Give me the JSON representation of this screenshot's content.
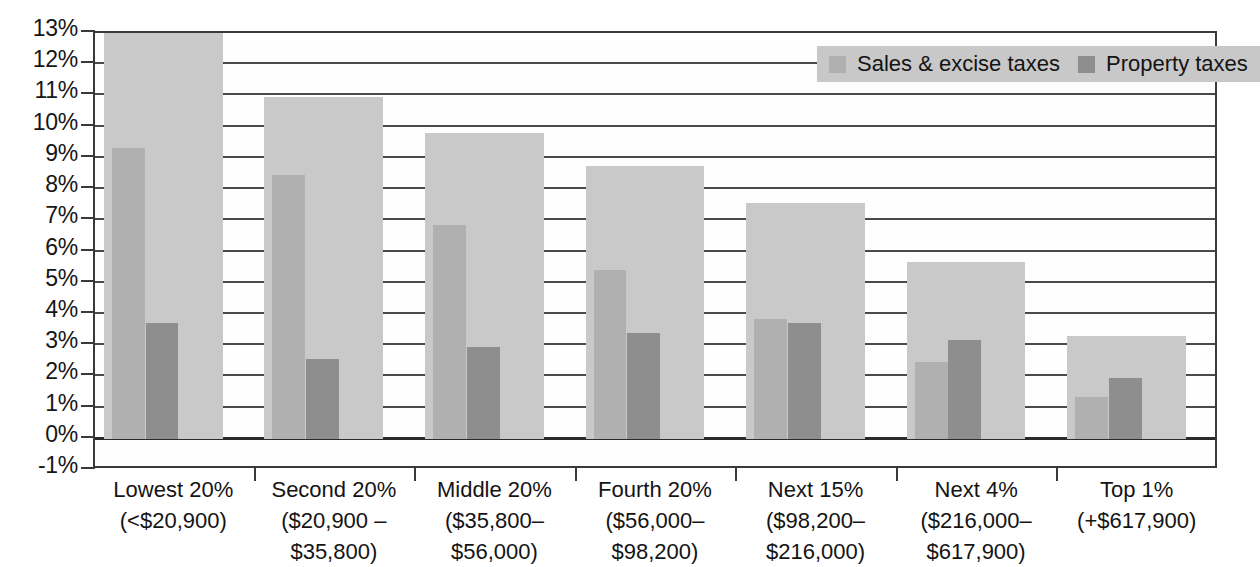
{
  "chart_data": {
    "type": "bar",
    "title": "",
    "xlabel": "",
    "ylabel": "",
    "ylim": [
      -1,
      13
    ],
    "ytick_labels": [
      "13%",
      "12%",
      "11%",
      "10%",
      "9%",
      "8%",
      "7%",
      "6%",
      "5%",
      "4%",
      "3%",
      "2%",
      "1%",
      "0%",
      "-1%"
    ],
    "ytick_values": [
      13,
      12,
      11,
      10,
      9,
      8,
      7,
      6,
      5,
      4,
      3,
      2,
      1,
      0,
      -1
    ],
    "grid": true,
    "legend_position": "top-right",
    "categories": [
      {
        "line1": "Lowest 20%",
        "line2": "(<$20,900)",
        "line3": ""
      },
      {
        "line1": "Second 20%",
        "line2": "($20,900 –",
        "line3": "$35,800)"
      },
      {
        "line1": "Middle 20%",
        "line2": "($35,800–",
        "line3": "$56,000)"
      },
      {
        "line1": "Fourth 20%",
        "line2": "($56,000–",
        "line3": "$98,200)"
      },
      {
        "line1": "Next 15%",
        "line2": "($98,200–",
        "line3": "$216,000)"
      },
      {
        "line1": "Next 4%",
        "line2": "($216,000–",
        "line3": "$617,900)"
      },
      {
        "line1": "Top 1%",
        "line2": "(+$617,900)",
        "line3": ""
      }
    ],
    "series": [
      {
        "name": "Total taxes",
        "key": "total",
        "color": "#c9c9c9",
        "values": [
          13.2,
          10.95,
          9.8,
          8.75,
          7.55,
          5.65,
          3.3
        ]
      },
      {
        "name": "Sales & excise taxes",
        "key": "sales",
        "color": "#b0b0b0",
        "values": [
          9.3,
          8.45,
          6.85,
          5.4,
          3.85,
          2.45,
          1.35
        ]
      },
      {
        "name": "Property taxes",
        "key": "prop",
        "color": "#8e8e8e",
        "values": [
          3.7,
          2.55,
          2.95,
          3.4,
          3.7,
          3.15,
          1.95
        ]
      }
    ],
    "legend": [
      {
        "label": "Sales & excise taxes",
        "color": "#b0b0b0"
      },
      {
        "label": "Property taxes",
        "color": "#8e8e8e"
      }
    ]
  }
}
